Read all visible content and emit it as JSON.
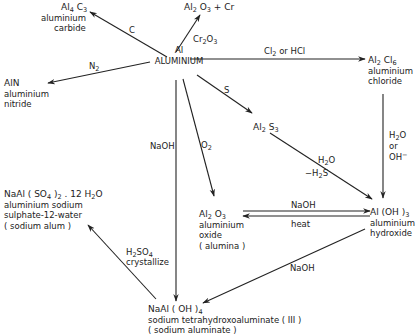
{
  "diagram": {
    "center": {
      "formula_html": "Al",
      "name": "ALUMINIUM"
    },
    "nodes": {
      "al4c3": {
        "formula_html": "Al<sub>4</sub> C<sub>3</sub>",
        "lines": [
          "aluminium",
          "carbide"
        ]
      },
      "al2o3_cr": {
        "formula_html": "Al<sub>2</sub> O<sub>3</sub> + Cr"
      },
      "aln": {
        "formula_html": "AlN",
        "lines": [
          "aluminium",
          "nitride"
        ]
      },
      "al2cl6": {
        "formula_html": "Al<sub>2</sub> Cl<sub>6</sub>",
        "lines": [
          "aluminium",
          "chloride"
        ]
      },
      "al2s3": {
        "formula_html": "Al<sub>2</sub> S<sub>3</sub>"
      },
      "al2o3": {
        "formula_html": "Al<sub>2</sub> O<sub>3</sub>",
        "lines": [
          "aluminium",
          "oxide",
          "( alumina )"
        ]
      },
      "aloh3": {
        "formula_html": "Al (OH )<sub>3</sub>",
        "lines": [
          "aluminium",
          "hydroxide"
        ]
      },
      "alum": {
        "formula_html": "NaAl ( SO<sub>4</sub> )<sub>2</sub> . 12 H<sub>2</sub>O",
        "lines": [
          "aluminium sodium",
          "sulphate-12-water",
          "( sodium alum )"
        ]
      },
      "aluminate": {
        "formula_html": "NaAl ( OH )<sub>4</sub>",
        "lines": [
          "sodium tetrahydroxoaluminate ( III )",
          "( sodium aluminate )"
        ]
      }
    },
    "reagents": {
      "c": "C",
      "cr2o3_html": "Cr<sub>2</sub>O<sub>3</sub>",
      "n2_html": "N<sub>2</sub>",
      "cl2_hcl_html": "Cl<sub>2</sub> or HCl",
      "s": "S",
      "naoh_down": "NaOH",
      "o2_html": "O<sub>2</sub>",
      "h2o_html": "H<sub>2</sub>O",
      "minus_h2s_html": "&minus;H<sub>2</sub>S",
      "h2o_or_oh_html": "H<sub>2</sub>O<br>or<br>OH<sup>&minus;</sup>",
      "naoh_eq": "NaOH",
      "heat": "heat",
      "naoh_diag": "NaOH",
      "h2so4_html": "H<sub>2</sub>SO<sub>4</sub>",
      "crystallize": "crystallize"
    },
    "colors": {
      "ink": "#222222",
      "background": "#ffffff"
    }
  }
}
